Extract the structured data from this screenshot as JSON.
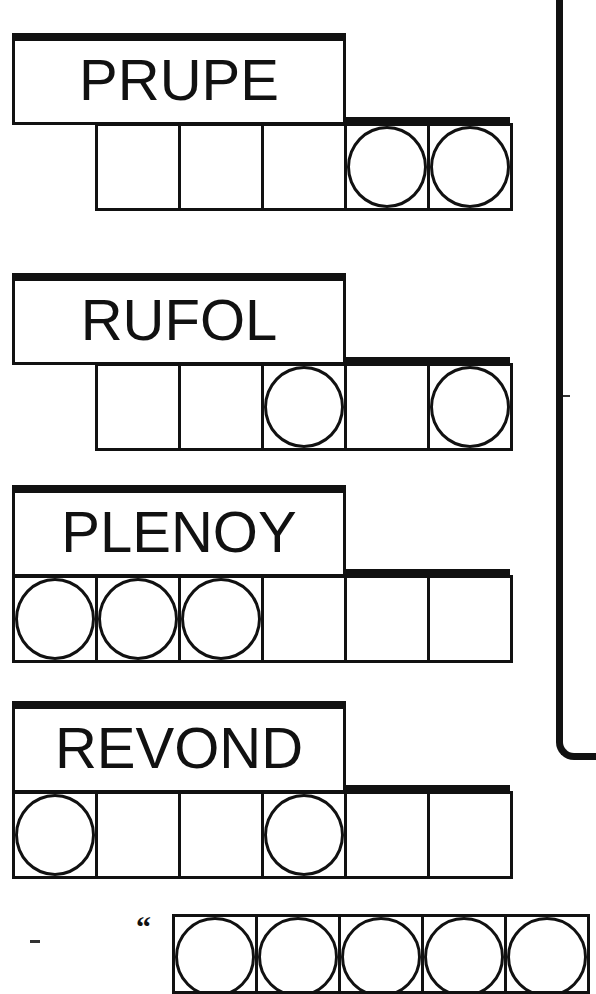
{
  "puzzles": [
    {
      "scrambled": "PRUPE",
      "top": 33,
      "cells": [
        {
          "present": false,
          "circled": false
        },
        {
          "present": true,
          "circled": false
        },
        {
          "present": true,
          "circled": false
        },
        {
          "present": true,
          "circled": false
        },
        {
          "present": true,
          "circled": true
        },
        {
          "present": true,
          "circled": true
        }
      ]
    },
    {
      "scrambled": "RUFOL",
      "top": 273,
      "cells": [
        {
          "present": false,
          "circled": false
        },
        {
          "present": true,
          "circled": false
        },
        {
          "present": true,
          "circled": false
        },
        {
          "present": true,
          "circled": true
        },
        {
          "present": true,
          "circled": false
        },
        {
          "present": true,
          "circled": true
        }
      ]
    },
    {
      "scrambled": "PLENOY",
      "top": 485,
      "cells": [
        {
          "present": true,
          "circled": true
        },
        {
          "present": true,
          "circled": true
        },
        {
          "present": true,
          "circled": true
        },
        {
          "present": true,
          "circled": false
        },
        {
          "present": true,
          "circled": false
        },
        {
          "present": true,
          "circled": false
        }
      ]
    },
    {
      "scrambled": "REVOND",
      "top": 701,
      "cells": [
        {
          "present": true,
          "circled": true
        },
        {
          "present": true,
          "circled": false
        },
        {
          "present": true,
          "circled": false
        },
        {
          "present": true,
          "circled": true
        },
        {
          "present": true,
          "circled": false
        },
        {
          "present": true,
          "circled": false
        }
      ]
    }
  ],
  "answer": {
    "opening_quote": "“",
    "visible_cells": 5,
    "all_circled": true
  },
  "colors": {
    "ink": "#111111",
    "background": "#ffffff"
  }
}
